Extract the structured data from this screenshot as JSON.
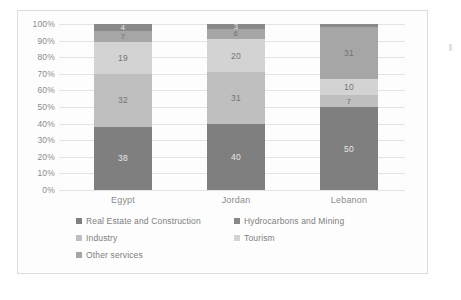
{
  "chart_data": {
    "type": "bar",
    "subtype": "100% stacked bar",
    "title": "",
    "xlabel": "",
    "ylabel": "",
    "ylim": [
      0,
      100
    ],
    "grid": true,
    "legend_position": "bottom",
    "categories": [
      "Egypt",
      "Jordan",
      "Lebanon"
    ],
    "ytick_labels": [
      "0%",
      "10%",
      "20%",
      "30%",
      "40%",
      "50%",
      "60%",
      "70%",
      "80%",
      "90%",
      "100%"
    ],
    "ytick_values": [
      0,
      10,
      20,
      30,
      40,
      50,
      60,
      70,
      80,
      90,
      100
    ],
    "series": [
      {
        "name": "Real Estate and Construction",
        "color": "#7f7f7f",
        "values": [
          38,
          40,
          50
        ],
        "labels": [
          "38",
          "40",
          "50"
        ]
      },
      {
        "name": "Industry",
        "color": "#bfbfbf",
        "values": [
          32,
          31,
          7
        ],
        "labels": [
          "32",
          "31",
          "7"
        ]
      },
      {
        "name": "Tourism",
        "color": "#d3d3d3",
        "values": [
          19,
          20,
          10
        ],
        "labels": [
          "19",
          "20",
          "10"
        ]
      },
      {
        "name": "Other services",
        "color": "#a6a6a6",
        "values": [
          7,
          6,
          31
        ],
        "labels": [
          "7",
          "6",
          "31"
        ]
      },
      {
        "name": "Hydrocarbons and Mining",
        "color": "#898989",
        "values": [
          4,
          3,
          2
        ],
        "labels": [
          "4",
          "3",
          ""
        ]
      }
    ]
  },
  "legend": {
    "rows": [
      [
        {
          "label": "Real Estate and Construction",
          "color": "#7f7f7f"
        },
        {
          "label": "Hydrocarbons and Mining",
          "color": "#898989"
        }
      ],
      [
        {
          "label": "Industry",
          "color": "#bfbfbf"
        },
        {
          "label": "Tourism",
          "color": "#d3d3d3"
        }
      ],
      [
        {
          "label": "Other services",
          "color": "#a6a6a6"
        }
      ]
    ]
  }
}
